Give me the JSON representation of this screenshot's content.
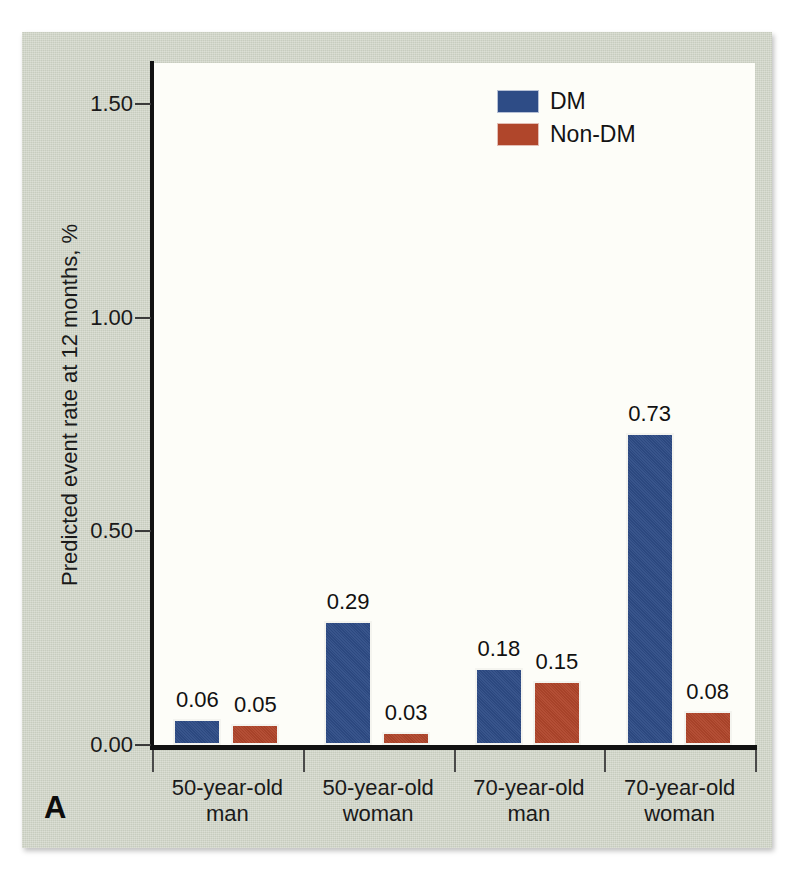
{
  "figure": {
    "panel_label": "A",
    "background_color": "#ced3c5",
    "plot_background_color": "#fdfdf8"
  },
  "chart_data": {
    "type": "bar",
    "title": "",
    "xlabel": "",
    "ylabel": "Predicted event rate at 12 months, %",
    "categories": [
      "50-year-old man",
      "50-year-old woman",
      "70-year-old man",
      "70-year-old woman"
    ],
    "category_lines": [
      [
        "50-year-old",
        "man"
      ],
      [
        "50-year-old",
        "woman"
      ],
      [
        "70-year-old",
        "man"
      ],
      [
        "70-year-old",
        "woman"
      ]
    ],
    "series": [
      {
        "name": "DM",
        "color": "#2e4c86",
        "values": [
          0.06,
          0.29,
          0.18,
          0.73
        ]
      },
      {
        "name": "Non-DM",
        "color": "#b0462b",
        "values": [
          0.05,
          0.03,
          0.15,
          0.08
        ]
      }
    ],
    "value_labels": [
      [
        "0.06",
        "0.05"
      ],
      [
        "0.29",
        "0.03"
      ],
      [
        "0.18",
        "0.15"
      ],
      [
        "0.73",
        "0.08"
      ]
    ],
    "ylim": [
      0.0,
      1.6
    ],
    "yticks": [
      0.0,
      0.5,
      1.0,
      1.5
    ],
    "ytick_labels": [
      "0.00",
      "0.50",
      "1.00",
      "1.50"
    ],
    "grid": false,
    "legend_position": "top-right"
  },
  "legend": {
    "entries": [
      {
        "label": "DM",
        "color": "#2e4c86"
      },
      {
        "label": "Non-DM",
        "color": "#b0462b"
      }
    ]
  }
}
